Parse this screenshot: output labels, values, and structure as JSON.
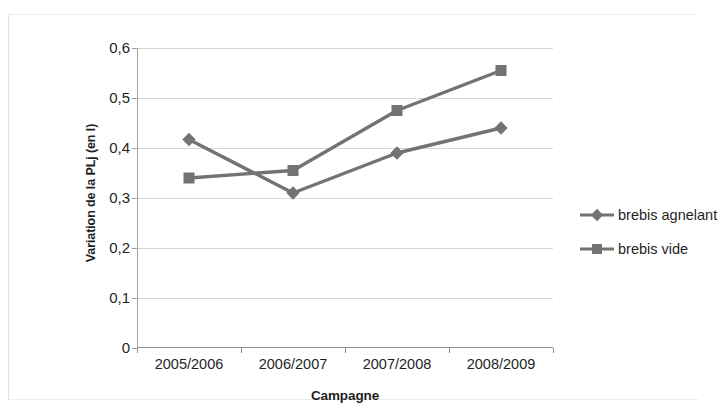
{
  "chart_data": {
    "type": "line",
    "title": "",
    "xlabel": "Campagne",
    "ylabel": "Variation de la PLj (en l)",
    "categories": [
      "2005/2006",
      "2006/2007",
      "2007/2008",
      "2008/2009"
    ],
    "ylim": [
      0,
      0.6
    ],
    "yticks": [
      0.6,
      0.5,
      0.4,
      0.3,
      0.2,
      0.1,
      0
    ],
    "ytick_labels": [
      "0,6",
      "0,5",
      "0,4",
      "0,3",
      "0,2",
      "0,1",
      "0"
    ],
    "grid": true,
    "legend_position": "right",
    "series": [
      {
        "name": "brebis agnelant",
        "marker": "diamond",
        "color": "#737373",
        "values": [
          0.417,
          0.31,
          0.39,
          0.44
        ]
      },
      {
        "name": "brebis vide",
        "marker": "square",
        "color": "#737373",
        "values": [
          0.34,
          0.355,
          0.475,
          0.555
        ]
      }
    ]
  },
  "colors": {
    "series_gray": "#737373",
    "gridline": "#d7d7d7",
    "axis": "#8f8f8f",
    "text": "#1f1f1f"
  }
}
